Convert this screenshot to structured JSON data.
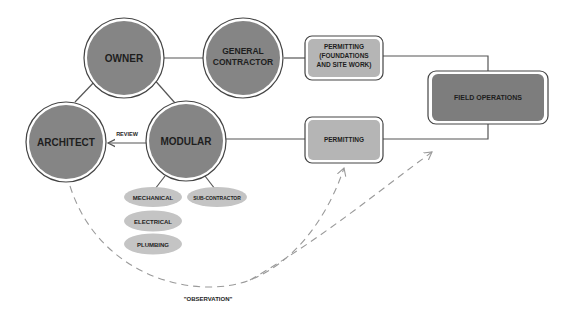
{
  "colors": {
    "circle_fill": "#858585",
    "box_light_fill": "#b5b5b5",
    "box_dark_fill": "#7d7d7d",
    "ellipse_fill": "#c4c4c4",
    "line": "#555555",
    "dash": "#9a9a9a",
    "text": "#1e1e1e"
  },
  "nodes": {
    "owner": {
      "label": "OWNER"
    },
    "general_contractor": {
      "line1": "GENERAL",
      "line2": "CONTRACTOR"
    },
    "architect": {
      "label": "ARCHITECT"
    },
    "modular": {
      "label": "MODULAR"
    },
    "permitting_foundations": {
      "line1": "PERMITTING",
      "line2": "(FOUNDATIONS",
      "line3": "AND SITE WORK)"
    },
    "permitting": {
      "label": "PERMITTING"
    },
    "field_operations": {
      "label": "FIELD OPERATIONS"
    },
    "mechanical": {
      "label": "MECHANICAL"
    },
    "sub_contractor": {
      "label": "SUB-CONTRACTOR"
    },
    "electrical": {
      "label": "ELECTRICAL"
    },
    "plumbing": {
      "label": "PLUMBING"
    }
  },
  "edges": {
    "review_label": "REVIEW",
    "observation_label": "\"OBSERVATION\""
  }
}
